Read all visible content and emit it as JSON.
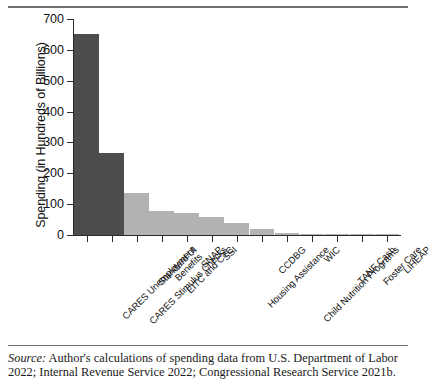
{
  "figure": {
    "source_prefix": "Source:",
    "source_text": " Author's calculations of spending data from U.S. Department of Labor 2022; Internal Revenue Service 2022; Congressional Research Service 2021b."
  },
  "chart_data": {
    "type": "bar",
    "title": "",
    "xlabel": "",
    "ylabel": "Spending (in Hundreds of Billions)",
    "ylim": [
      0,
      700
    ],
    "yticks": [
      0,
      100,
      200,
      300,
      400,
      500,
      600,
      700
    ],
    "ytick_labels": [
      "0",
      "100",
      "200",
      "300",
      "400",
      "500",
      "600",
      "700"
    ],
    "grid": false,
    "legend": false,
    "categories": [
      "CARES Unemployment Benefits",
      "CARES Stimulus Checks",
      "Standard UI",
      "EITC and CTC",
      "SNAP",
      "SSI",
      "Housing Assistance",
      "CCDBG",
      "Child Nutrition Programs",
      "WIC",
      "TANF Cash",
      "Foster Care",
      "LIHEAP"
    ],
    "category_lines": [
      [
        "CARES Unemployment",
        "Benefits"
      ],
      [
        "CARES Stimulus Checks"
      ],
      [
        "Standard UI"
      ],
      [
        "EITC and CTC"
      ],
      [
        "SNAP"
      ],
      [
        "SSI"
      ],
      [
        "Housing Assistance"
      ],
      [
        "CCDBG"
      ],
      [
        "Child Nutrition Programs"
      ],
      [
        "WIC"
      ],
      [
        "TANF Cash"
      ],
      [
        "Foster Care"
      ],
      [
        "LIHEAP"
      ]
    ],
    "values": [
      650,
      265,
      137,
      78,
      70,
      57,
      38,
      20,
      5,
      2,
      2,
      1,
      1
    ],
    "bar_colors": [
      "#4d4d4d",
      "#4d4d4d",
      "#b2b2b2",
      "#b2b2b2",
      "#b2b2b2",
      "#b2b2b2",
      "#b2b2b2",
      "#b2b2b2",
      "#b2b2b2",
      "#b2b2b2",
      "#b2b2b2",
      "#b2b2b2",
      "#b2b2b2"
    ],
    "colors": {
      "dark_bar": "#4d4d4d",
      "light_bar": "#b2b2b2",
      "axis": "#2b2b2b",
      "rule": "#6f6f6f",
      "background": "#ffffff"
    }
  }
}
